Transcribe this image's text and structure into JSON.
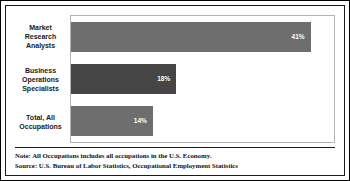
{
  "chart_data": {
    "type": "bar",
    "orientation": "horizontal",
    "title": "",
    "subtitle": "",
    "xlabel": "",
    "ylabel": "",
    "categories": [
      "Market Research Analysts",
      "Business Operations Specialists",
      "Total, All Occupations"
    ],
    "values": [
      41,
      18,
      14
    ],
    "value_labels": [
      "41%",
      "18%",
      "14%"
    ],
    "xlim": [
      0,
      45
    ],
    "grid": false,
    "legend": false,
    "bar_colors": [
      "#6e6e6e",
      "#454545",
      "#6e6e6e"
    ],
    "value_label_color": "#ffffff"
  },
  "categories": [
    {
      "label_line1": "Market",
      "label_line2": "Research",
      "label_line3": "Analysts",
      "value_label": "41%"
    },
    {
      "label_line1": "Business",
      "label_line2": "Operations",
      "label_line3": "Specialists",
      "value_label": "18%"
    },
    {
      "label_line1": "Total, All",
      "label_line2": "Occupations",
      "label_line3": "",
      "value_label": "14%"
    }
  ],
  "footnotes": {
    "note": "Note: All Occupations includes all occupations in the U.S. Economy.",
    "source": "Source: U.S. Bureau of Labor Statistics, Occupational Employment Statistics"
  },
  "colors": {
    "bar_light": "#6e6e6e",
    "bar_dark": "#454545",
    "frame": "#000000",
    "plot_border": "#b4b4b4",
    "text": "#1a1a1a"
  }
}
